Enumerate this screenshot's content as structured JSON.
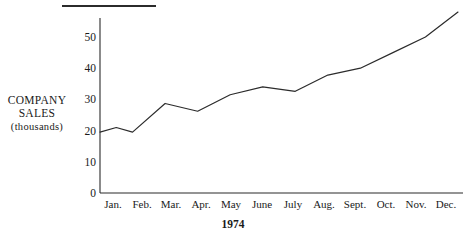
{
  "chart_data": {
    "type": "line",
    "title": "",
    "xlabel": "1974",
    "ylabel": "COMPANY SALES (thousands)",
    "ylabel_lines": [
      "COMPANY",
      "SALES",
      "(thousands)"
    ],
    "categories": [
      "Jan.",
      "Feb.",
      "Mar.",
      "Apr.",
      "May",
      "June",
      "July",
      "Aug.",
      "Sept.",
      "Oct.",
      "Nov.",
      "Dec."
    ],
    "values": [
      19.5,
      19.5,
      28.7,
      26.2,
      31.5,
      34,
      32.6,
      37.8,
      40,
      45,
      50,
      58
    ],
    "series": [
      {
        "name": "Company sales",
        "values": [
          19.5,
          19.5,
          28.7,
          26.2,
          31.5,
          34,
          32.6,
          37.8,
          40,
          45,
          50,
          58
        ]
      }
    ],
    "yticks": [
      0,
      10,
      20,
      30,
      40,
      50
    ],
    "ylim": [
      0,
      60
    ],
    "grid": false,
    "legend": "none",
    "line_color": "#2b2b2b",
    "interior_peak_feb": 21
  },
  "decorations": {
    "top_rule": "horizontal-rule"
  }
}
